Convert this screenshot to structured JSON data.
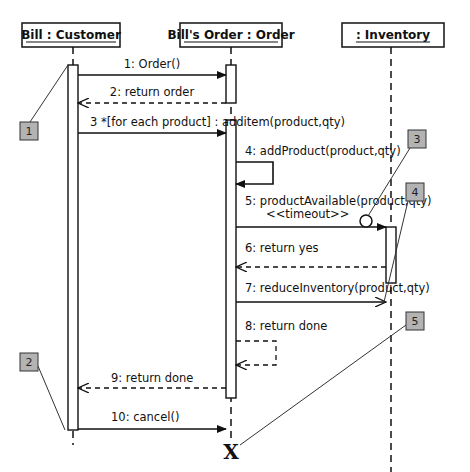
{
  "diagram": {
    "type": "uml-sequence-diagram",
    "lifelines": [
      {
        "id": "customer",
        "label": "Bill : Customer",
        "x": 73,
        "box": {
          "x": 22,
          "y": 23,
          "w": 98,
          "h": 24
        },
        "line_end": 445
      },
      {
        "id": "order",
        "label": "Bill's Order : Order",
        "x": 231,
        "box": {
          "x": 180,
          "y": 23,
          "w": 102,
          "h": 24
        },
        "line_end": 440
      },
      {
        "id": "inventory",
        "label": ": Inventory",
        "x": 391,
        "box": {
          "x": 342,
          "y": 23,
          "w": 102,
          "h": 24
        },
        "line_end": 472
      }
    ],
    "activations": [
      {
        "lifeline": "customer",
        "x": 68,
        "y1": 65,
        "y2": 430
      },
      {
        "lifeline": "order",
        "x": 226,
        "y1": 65,
        "y2": 103
      },
      {
        "lifeline": "order",
        "x": 226,
        "y1": 120,
        "y2": 398
      },
      {
        "lifeline": "inventory",
        "x": 386,
        "y1": 227,
        "y2": 283
      }
    ],
    "messages": [
      {
        "id": 1,
        "label": "1: Order()",
        "kind": "sync",
        "x1": 78,
        "x2": 226,
        "y": 75,
        "label_x": 152,
        "label_y": 68,
        "anchor": "middle"
      },
      {
        "id": 2,
        "label": "2: return order",
        "kind": "return",
        "x1": 226,
        "x2": 78,
        "y": 103,
        "label_x": 152,
        "label_y": 96,
        "anchor": "middle"
      },
      {
        "id": 3,
        "label": "3 *[for each product] : additem(product,qty)",
        "kind": "sync",
        "x1": 78,
        "x2": 226,
        "y": 133,
        "label_x": 90,
        "label_y": 126,
        "anchor": "start"
      },
      {
        "id": 4,
        "label": "4: addProduct(product,qty)",
        "kind": "self-sync",
        "x": 236,
        "y1": 162,
        "y2": 184,
        "loop_w": 37,
        "label_x": 245,
        "label_y": 155,
        "anchor": "start"
      },
      {
        "id": 5,
        "label": "5: productAvailable(product,qty)",
        "kind": "sync",
        "x1": 236,
        "x2": 386,
        "y": 227,
        "label_x": 245,
        "label_y": 205,
        "anchor": "start"
      },
      {
        "id": 6,
        "label": "6: return yes",
        "kind": "return",
        "x1": 386,
        "x2": 236,
        "y": 267,
        "label_x": 245,
        "label_y": 252,
        "anchor": "start"
      },
      {
        "id": 7,
        "label": "7: reduceInventory(product,qty)",
        "kind": "async",
        "x1": 236,
        "x2": 386,
        "y": 302,
        "label_x": 245,
        "label_y": 292,
        "anchor": "start"
      },
      {
        "id": 8,
        "label": "8: return done",
        "kind": "self-return",
        "x": 236,
        "y1": 341,
        "y2": 365,
        "loop_w": 40,
        "label_x": 245,
        "label_y": 330,
        "anchor": "start"
      },
      {
        "id": 9,
        "label": "9: return done",
        "kind": "return",
        "x1": 226,
        "x2": 78,
        "y": 388,
        "label_x": 111,
        "label_y": 382,
        "anchor": "start"
      },
      {
        "id": 10,
        "label": "10: cancel()",
        "kind": "sync",
        "x1": 78,
        "x2": 226,
        "y": 429,
        "label_x": 111,
        "label_y": 421,
        "anchor": "start"
      }
    ],
    "constraint": {
      "label": "<<timeout>>",
      "x": 266,
      "y": 218,
      "circle": {
        "cx": 366,
        "cy": 221,
        "r": 6
      }
    },
    "destroy": {
      "label": "X",
      "x": 231,
      "y": 459
    },
    "callouts": [
      {
        "label": "1",
        "box": {
          "x": 20,
          "y": 122,
          "w": 18,
          "h": 18
        },
        "line": [
          30,
          122,
          68,
          65
        ]
      },
      {
        "label": "2",
        "box": {
          "x": 20,
          "y": 353,
          "w": 18,
          "h": 18
        },
        "line": [
          38,
          366,
          65,
          430
        ]
      },
      {
        "label": "3",
        "box": {
          "x": 408,
          "y": 130,
          "w": 18,
          "h": 18
        },
        "line": [
          410,
          148,
          368,
          216
        ]
      },
      {
        "label": "4",
        "box": {
          "x": 406,
          "y": 183,
          "w": 18,
          "h": 18
        },
        "line": [
          408,
          201,
          384,
          302
        ]
      },
      {
        "label": "5",
        "box": {
          "x": 406,
          "y": 312,
          "w": 18,
          "h": 18
        },
        "line": [
          406,
          325,
          240,
          445
        ]
      }
    ],
    "colors": {
      "stroke": "#111111",
      "callout_fill": "#b3b3b3",
      "callout_stroke": "#333333",
      "background": "#ffffff"
    }
  }
}
